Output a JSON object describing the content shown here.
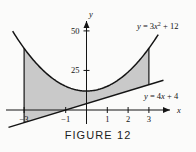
{
  "figure": {
    "caption": "FIGURE 12",
    "background_color": "#fbfbfa",
    "shade_color": "#c9c9c9",
    "stroke_color": "#141414"
  },
  "axes": {
    "x_axis_name": "x",
    "y_axis_name": "y",
    "x_ticks": [
      {
        "label": "-3",
        "value": -3
      },
      {
        "label": "-1",
        "value": -1
      },
      {
        "label": "1",
        "value": 1
      },
      {
        "label": "2",
        "value": 2
      },
      {
        "label": "3",
        "value": 3
      }
    ],
    "y_ticks": [
      {
        "label": "25",
        "value": 25
      },
      {
        "label": "50",
        "value": 50
      }
    ],
    "xlim": [
      -3.9,
      3.8
    ],
    "ylim": [
      -12,
      58
    ]
  },
  "labels": {
    "parabola": {
      "prefix": "y",
      "equals": " = 3",
      "variable": "x",
      "exponent": "2",
      "suffix": " + 12",
      "full": "y = 3x2 + 12"
    },
    "line": {
      "prefix": "y",
      "equals": " = 4",
      "variable": "x",
      "suffix": " + 4",
      "full": "y = 4x + 4"
    }
  },
  "chart_data": {
    "type": "line",
    "title": "FIGURE 12",
    "xlabel": "x",
    "ylabel": "y",
    "xlim": [
      -3.9,
      3.8
    ],
    "ylim": [
      -12,
      58
    ],
    "grid": false,
    "legend": "inline-labels",
    "shaded_region": {
      "description": "Region between the parabola and the line from x = -3 to x = 3",
      "x_from": -3,
      "x_to": 3,
      "upper_curve": "y = 3x^2 + 12",
      "lower_curve": "y = 4x + 4",
      "fill_color": "#c9c9c9"
    },
    "series": [
      {
        "name": "y = 3x2 + 12",
        "equation": "y = 3*x^2 + 12",
        "x": [
          -3.55,
          -3.0,
          -2.5,
          -2.0,
          -1.5,
          -1.0,
          -0.5,
          0.0,
          0.5,
          1.0,
          1.5,
          2.0,
          2.5,
          3.0,
          3.45
        ],
        "values": [
          49.8,
          39,
          30.75,
          24,
          18.75,
          15,
          12.75,
          12,
          12.75,
          15,
          18.75,
          24,
          30.75,
          39,
          47.7
        ]
      },
      {
        "name": "y = 4x + 4",
        "equation": "y = 4*x + 4",
        "x": [
          -3.75,
          -3.0,
          -1.0,
          0.0,
          1.0,
          2.0,
          3.0,
          3.7
        ],
        "values": [
          -11,
          -8,
          0,
          4,
          8,
          12,
          16,
          18.8
        ]
      }
    ],
    "vertical_boundaries": [
      {
        "x": -3,
        "y_from": -8,
        "y_to": 39
      },
      {
        "x": 3,
        "y_from": 16,
        "y_to": 39
      }
    ]
  }
}
